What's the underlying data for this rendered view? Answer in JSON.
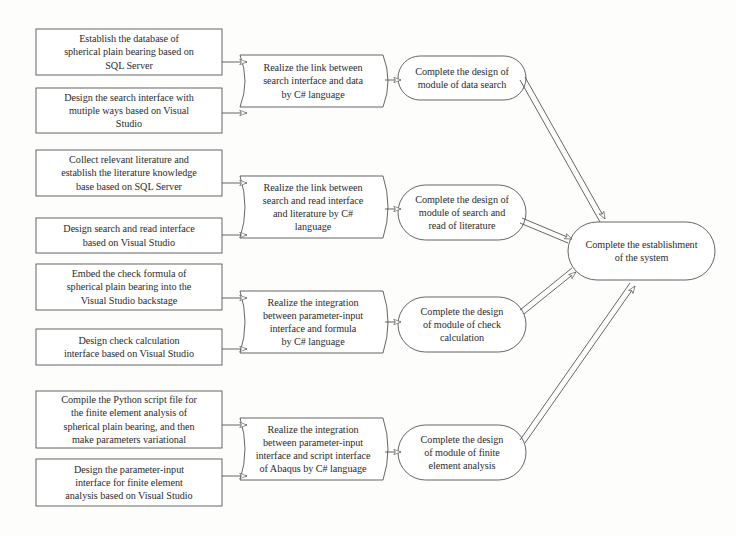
{
  "figure": {
    "type": "flowchart",
    "orientation": "left-to-right",
    "background_color": "#fdfdfc",
    "stroke_color": "#4a4a4a",
    "text_color": "#2b2b2b"
  },
  "header": {
    "faint_cropped_line": ""
  },
  "columns": {
    "tasks_label": "Task boxes",
    "realization_label": "Realization steps",
    "module_label": "Module completion",
    "system_label": "System completion"
  },
  "tasks": [
    {
      "id": "task-1",
      "lines": [
        "Establish the database of",
        "spherical plain bearing based on",
        "SQL Server"
      ]
    },
    {
      "id": "task-2",
      "lines": [
        "Design the search interface with",
        "mutiple ways based on Visual",
        "Studio"
      ]
    },
    {
      "id": "task-3",
      "lines": [
        "Collect relevant literature and",
        "establish the literature knowledge",
        "base based on  SQL Server"
      ]
    },
    {
      "id": "task-4",
      "lines": [
        "Design search and read interface",
        "based on Visual Studio"
      ]
    },
    {
      "id": "task-5",
      "lines": [
        "Embed the check formula of",
        "spherical plain bearing into the",
        "Visual Studio backstage"
      ]
    },
    {
      "id": "task-6",
      "lines": [
        "Design check calculation",
        "interface based on Visual Studio"
      ]
    },
    {
      "id": "task-7",
      "lines": [
        "Compile the Python script file for",
        "the finite element analysis of",
        "spherical plain bearing, and then",
        "make parameters variational"
      ]
    },
    {
      "id": "task-8",
      "lines": [
        "Design the parameter-input",
        "interface for finite element",
        "analysis based on Visual Studio"
      ]
    }
  ],
  "realizations": [
    {
      "id": "realize-1",
      "lines": [
        "Realize the link between",
        "search interface and data",
        "by C# language"
      ]
    },
    {
      "id": "realize-2",
      "lines": [
        "Realize the link between",
        "search and read interface",
        "and literature by C#",
        "language"
      ]
    },
    {
      "id": "realize-3",
      "lines": [
        "Realize the integration",
        "between parameter-input",
        "interface and formula",
        "by C# language"
      ]
    },
    {
      "id": "realize-4",
      "lines": [
        "Realize the integration",
        "between parameter-input",
        "interface and script interface",
        "of Abaqus by C# language"
      ]
    }
  ],
  "modules": [
    {
      "id": "module-1",
      "lines": [
        "Complete the design of",
        "module of data search"
      ]
    },
    {
      "id": "module-2",
      "lines": [
        "Complete the design of",
        "module of search and",
        "read of literature"
      ]
    },
    {
      "id": "module-3",
      "lines": [
        "Complete the design",
        "of module of check",
        "calculation"
      ]
    },
    {
      "id": "module-4",
      "lines": [
        "Complete the design",
        "of module of finite",
        "element analysis"
      ]
    }
  ],
  "system": {
    "id": "system-node",
    "lines": [
      "Complete the establishment",
      "of the system"
    ]
  }
}
